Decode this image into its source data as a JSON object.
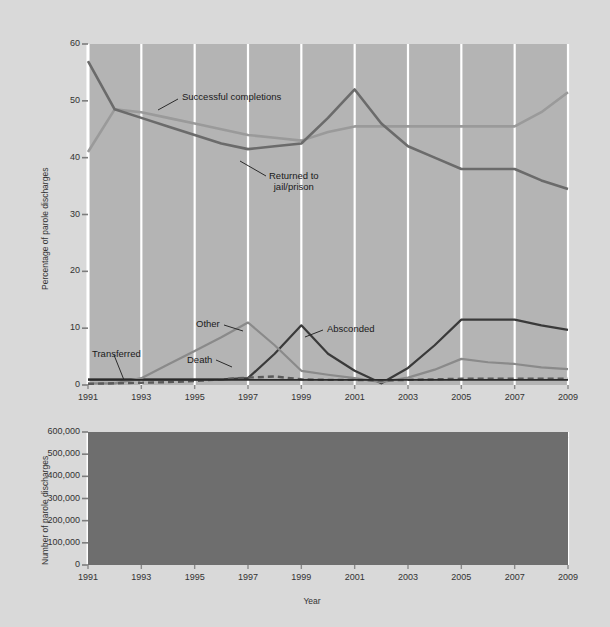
{
  "figure": {
    "background_color": "#d9d9d9",
    "top_panel_bg": "#b4b4b4",
    "bottom_panel_bg": "#6e6e6e",
    "gridline_color": "#ffffff"
  },
  "chart_data": [
    {
      "type": "line",
      "panel": "top",
      "title": "",
      "xlabel": "",
      "ylabel": "Percentage of parole discharges",
      "xlim": [
        1991,
        2009
      ],
      "ylim": [
        0,
        60
      ],
      "yticks": [
        0,
        10,
        20,
        30,
        40,
        50,
        60
      ],
      "ytick_labels": [
        "0",
        "10",
        "20",
        "30",
        "40",
        "50",
        "60"
      ],
      "xticks": [
        1991,
        1993,
        1995,
        1997,
        1999,
        2001,
        2003,
        2005,
        2007,
        2009
      ],
      "xtick_labels": [
        "1991",
        "1993",
        "1995",
        "1997",
        "1999",
        "2001",
        "2003",
        "2005",
        "2007",
        "2009"
      ],
      "grid": "vertical-white-at-xticks",
      "legend_position": "inline-annotations",
      "x": [
        1991,
        1992,
        1993,
        1994,
        1995,
        1996,
        1997,
        1998,
        1999,
        2000,
        2001,
        2002,
        2003,
        2004,
        2005,
        2006,
        2007,
        2008,
        2009
      ],
      "series": [
        {
          "name": "Successful completions",
          "color": "#9a9a9a",
          "width": 2.6,
          "dash": "none",
          "values": [
            41,
            48.5,
            48,
            47,
            46,
            45,
            44,
            43.5,
            43,
            44.5,
            45.5,
            45.5,
            45.5,
            45.5,
            45.5,
            45.5,
            45.5,
            48,
            51.5
          ]
        },
        {
          "name": "Returned to jail/prison",
          "color": "#6b6b6b",
          "width": 2.6,
          "dash": "none",
          "values": [
            57,
            48.5,
            47,
            45.5,
            44,
            42.5,
            41.5,
            42,
            42.5,
            47,
            52,
            46,
            42,
            40,
            38,
            38,
            38,
            36,
            34.5
          ]
        },
        {
          "name": "Absconded",
          "color": "#3a3a3a",
          "width": 2.2,
          "dash": "none",
          "values": [
            1,
            1,
            1,
            1,
            1,
            1,
            1.2,
            5.5,
            10.5,
            5.5,
            2.5,
            0.3,
            3,
            7,
            11.5,
            11.5,
            11.5,
            10.5,
            9.7
          ]
        },
        {
          "name": "Other",
          "color": "#8a8a8a",
          "width": 2.2,
          "dash": "none",
          "values": [
            0.3,
            0.3,
            1.2,
            3.6,
            6,
            8.4,
            11,
            7,
            2.5,
            1.8,
            1.2,
            0.5,
            1.3,
            2.7,
            4.6,
            4,
            3.7,
            3.1,
            2.8
          ]
        },
        {
          "name": "Death",
          "color": "#5a5a5a",
          "width": 2.4,
          "dash": "6 4",
          "values": [
            0.2,
            0.3,
            0.4,
            0.5,
            0.7,
            1.0,
            1.3,
            1.5,
            1.0,
            0.9,
            0.9,
            0.8,
            0.9,
            1.0,
            1.1,
            1.1,
            1.1,
            1.1,
            1.1
          ]
        },
        {
          "name": "Transferred",
          "color": "#2a2a2a",
          "width": 1.6,
          "dash": "none",
          "values": [
            0.9,
            0.9,
            0.9,
            0.9,
            0.9,
            0.9,
            0.9,
            0.9,
            0.9,
            0.9,
            0.9,
            0.9,
            0.9,
            0.9,
            0.9,
            0.9,
            0.9,
            0.9,
            0.9
          ]
        }
      ],
      "annotations": [
        {
          "text": "Successful completions",
          "x_px": 182,
          "y_px": 91,
          "leader": [
            [
              178,
              99
            ],
            [
              158,
              110
            ]
          ]
        },
        {
          "text": "Returned to\njail/prison",
          "line1": "Returned to",
          "line2": "jail/prison",
          "x_px": 269,
          "y_px": 170,
          "leader": [
            [
              266,
              176
            ],
            [
              240,
              161
            ]
          ]
        },
        {
          "text": "Other",
          "x_px": 196,
          "y_px": 318,
          "leader": [
            [
              224,
              325
            ],
            [
              243,
              331
            ]
          ]
        },
        {
          "text": "Absconded",
          "x_px": 327,
          "y_px": 323,
          "leader": [
            [
              323,
              330
            ],
            [
              305,
              337
            ]
          ]
        },
        {
          "text": "Death",
          "x_px": 187,
          "y_px": 354,
          "leader": [
            [
              216,
              360
            ],
            [
              232,
              367
            ]
          ]
        },
        {
          "text": "Transferred",
          "x_px": 92,
          "y_px": 348,
          "leader": [
            [
              114,
              355
            ],
            [
              124,
              380
            ]
          ]
        }
      ]
    },
    {
      "type": "line",
      "panel": "bottom",
      "title": "",
      "xlabel": "Year",
      "ylabel": "Number of parole discharges",
      "xlim": [
        1991,
        2009
      ],
      "ylim": [
        0,
        600000
      ],
      "yticks": [
        0,
        100000,
        200000,
        300000,
        400000,
        500000,
        600000
      ],
      "ytick_labels": [
        "0",
        "100,000",
        "200,000",
        "300,000",
        "400,000",
        "500,000",
        "600,000"
      ],
      "xticks": [
        1991,
        1993,
        1995,
        1997,
        1999,
        2001,
        2003,
        2005,
        2007,
        2009
      ],
      "xtick_labels": [
        "1991",
        "1993",
        "1995",
        "1997",
        "1999",
        "2001",
        "2003",
        "2005",
        "2007",
        "2009"
      ],
      "grid": "vertical-white-at-xticks",
      "x": [
        1991,
        1992,
        1993,
        1994,
        1995,
        1996,
        1997,
        1998,
        1999,
        2000,
        2001,
        2002,
        2003,
        2004,
        2005,
        2006,
        2007,
        2008,
        2009
      ],
      "series": [
        {
          "name": "Number of parole discharges",
          "color": "#cfcfcf",
          "width": 3.2,
          "dash": "none",
          "values": [
            180000,
            210000,
            250000,
            290000,
            325000,
            370000,
            415000,
            428000,
            440000,
            400000,
            355000,
            300000,
            340000,
            430000,
            518000,
            520000,
            520000,
            550000,
            580000
          ]
        }
      ]
    }
  ]
}
